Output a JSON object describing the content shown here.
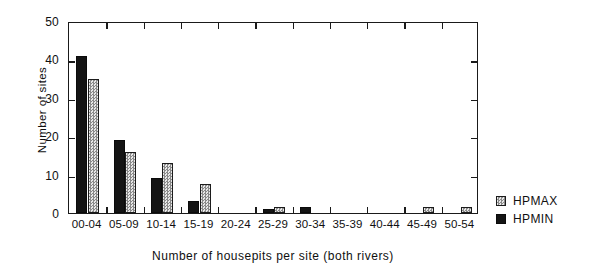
{
  "chart_data": {
    "type": "bar",
    "title": "",
    "xlabel": "Number of housepits per site (both rivers)",
    "ylabel": "Number of sites",
    "categories": [
      "00-04",
      "05-09",
      "10-14",
      "15-19",
      "20-24",
      "25-29",
      "30-34",
      "35-39",
      "40-44",
      "45-49",
      "50-54"
    ],
    "series": [
      {
        "name": "HPMIN",
        "values": [
          41,
          19,
          9,
          3,
          0,
          1,
          1.5,
          0,
          0,
          0,
          0
        ]
      },
      {
        "name": "HPMAX",
        "values": [
          35,
          16,
          13,
          7.5,
          0,
          1.5,
          0,
          0,
          0,
          1.5,
          1.5
        ]
      }
    ],
    "ylim": [
      0,
      50
    ],
    "yticks": [
      0,
      10,
      20,
      30,
      40,
      50
    ],
    "ytick_labels": [
      "0",
      "10",
      "20",
      "30",
      "40",
      "50"
    ],
    "grid": false,
    "legend_position": "right-bottom",
    "colors": {
      "hpmin": "#141414",
      "hpmax": "#8a8a8a",
      "axis": "#1a1a1a",
      "background": "#ffffff"
    }
  },
  "legend": {
    "items": [
      {
        "label": "HPMAX",
        "key": "hpmax"
      },
      {
        "label": "HPMIN",
        "key": "hpmin"
      }
    ]
  }
}
